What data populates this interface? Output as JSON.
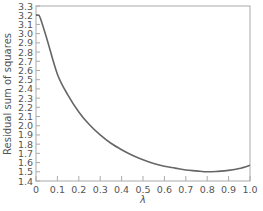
{
  "chart_data": {
    "type": "line",
    "title": "",
    "xlabel": "λ",
    "ylabel": "Residual sum of squares",
    "xlim": [
      0,
      1.0
    ],
    "ylim": [
      1.4,
      3.3
    ],
    "grid": false,
    "legend": null,
    "x_ticks": [
      "0",
      "0.1",
      "0.2",
      "0.3",
      "0.4",
      "0.5",
      "0.6",
      "0.7",
      "0.8",
      "0.9",
      "1.0"
    ],
    "y_ticks": [
      "1.4",
      "1.5",
      "1.6",
      "1.7",
      "1.8",
      "1.9",
      "2.0",
      "2.1",
      "2.2",
      "2.3",
      "2.4",
      "2.5",
      "2.6",
      "2.7",
      "2.8",
      "2.9",
      "3.0",
      "3.1",
      "3.2",
      "3.3"
    ],
    "series": [
      {
        "name": "Residual sum of squares",
        "color": "#666666",
        "x": [
          0.0,
          0.01,
          0.02,
          0.05,
          0.1,
          0.15,
          0.2,
          0.25,
          0.3,
          0.35,
          0.4,
          0.45,
          0.5,
          0.55,
          0.6,
          0.65,
          0.7,
          0.75,
          0.8,
          0.85,
          0.9,
          0.95,
          1.0
        ],
        "values": [
          3.2,
          3.2,
          3.17,
          2.95,
          2.56,
          2.33,
          2.15,
          2.01,
          1.9,
          1.81,
          1.74,
          1.68,
          1.63,
          1.59,
          1.56,
          1.54,
          1.52,
          1.51,
          1.5,
          1.505,
          1.515,
          1.535,
          1.57
        ]
      }
    ]
  },
  "axes": {
    "x_label": "λ",
    "y_label": "Residual sum of squares"
  },
  "colors": {
    "curve": "#666666",
    "frame": "#aaaaaa",
    "text": "#555555"
  }
}
